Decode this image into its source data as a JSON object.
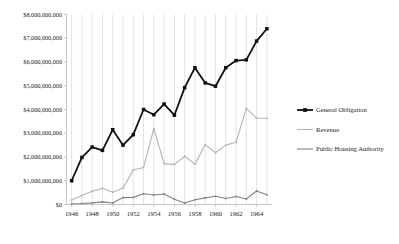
{
  "chart_data": {
    "type": "line",
    "title": "",
    "xlabel": "",
    "ylabel": "",
    "grid": "vertical",
    "legend_position": "right",
    "xlim": [
      1945.5,
      1965.5
    ],
    "ylim": [
      0,
      8000000000
    ],
    "x": [
      1946,
      1947,
      1948,
      1949,
      1950,
      1951,
      1952,
      1953,
      1954,
      1955,
      1956,
      1957,
      1958,
      1959,
      1960,
      1961,
      1962,
      1963,
      1964,
      1965
    ],
    "xtick_labels": [
      "1946",
      "1948",
      "1950",
      "1952",
      "1954",
      "1956",
      "1958",
      "1960",
      "1962",
      "1964"
    ],
    "xtick_values": [
      1946,
      1948,
      1950,
      1952,
      1954,
      1956,
      1958,
      1960,
      1962,
      1964
    ],
    "ytick_labels": [
      "$0",
      "$1,000,000,000",
      "$2,000,000,000",
      "$3,000,000,000",
      "$4,000,000,000",
      "$5,000,000,000",
      "$6,000,000,000",
      "$7,000,000,000",
      "$8,000,000,000"
    ],
    "ytick_values": [
      0,
      1000000000,
      2000000000,
      3000000000,
      4000000000,
      5000000000,
      6000000000,
      7000000000,
      8000000000
    ],
    "series": [
      {
        "name": "General Obligation",
        "color": "#111111",
        "marker": "square",
        "width": 1.8,
        "values": [
          1000000000,
          1980000000,
          2420000000,
          2280000000,
          3150000000,
          2500000000,
          2940000000,
          4000000000,
          3780000000,
          4230000000,
          3760000000,
          4920000000,
          5760000000,
          5120000000,
          4980000000,
          5760000000,
          6060000000,
          6090000000,
          6880000000,
          7400000000
        ]
      },
      {
        "name": "Revenue",
        "color": "#b4b4b4",
        "marker": "dot",
        "width": 1.1,
        "values": [
          190000000,
          380000000,
          560000000,
          680000000,
          520000000,
          690000000,
          1450000000,
          1560000000,
          3200000000,
          1720000000,
          1680000000,
          2030000000,
          1700000000,
          2520000000,
          2180000000,
          2500000000,
          2620000000,
          4050000000,
          3640000000,
          3620000000
        ]
      },
      {
        "name": "Public Housing Authority",
        "color": "#838383",
        "marker": "dot",
        "width": 1.1,
        "values": [
          30000000,
          40000000,
          70000000,
          110000000,
          60000000,
          290000000,
          300000000,
          450000000,
          400000000,
          440000000,
          220000000,
          60000000,
          200000000,
          280000000,
          350000000,
          250000000,
          340000000,
          230000000,
          570000000,
          410000000
        ]
      }
    ]
  },
  "legend": {
    "items": [
      {
        "label": "General Obligation"
      },
      {
        "label": "Revenue"
      },
      {
        "label": "Public Housing Authority"
      }
    ]
  }
}
